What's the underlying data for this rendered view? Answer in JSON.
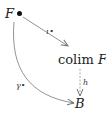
{
  "diagram": {
    "type": "commutative-diagram",
    "nodes": {
      "source": {
        "label": "F",
        "marker": "•"
      },
      "colimit": {
        "prefix": "colim",
        "label": "F"
      },
      "target": {
        "label": "B"
      }
    },
    "arrows": {
      "iota": {
        "from": "F",
        "to": "colim F",
        "label": "ι•",
        "style": "solid"
      },
      "h": {
        "from": "colim F",
        "to": "B",
        "label": "h",
        "style": "dashed"
      },
      "gamma": {
        "from": "F",
        "to": "B",
        "label": "γ•",
        "style": "solid-curved"
      }
    },
    "colors": {
      "ink": "#222222",
      "arrow": "#666666",
      "background": "#ffffff"
    }
  }
}
